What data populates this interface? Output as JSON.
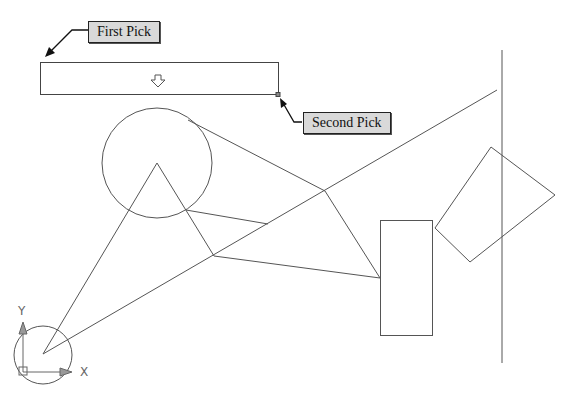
{
  "callouts": {
    "first_pick": "First Pick",
    "second_pick": "Second Pick"
  },
  "ucs": {
    "x_label": "X",
    "y_label": "Y"
  },
  "colors": {
    "line": "#555555",
    "callout_bg": "#d9d9d9",
    "callout_border": "#222222"
  },
  "geometry": {
    "selection_window": {
      "x1": 40,
      "y1": 62,
      "x2": 278,
      "y2": 94
    },
    "small_circle": {
      "cx": 43,
      "cy": 355,
      "r": 29
    },
    "large_circle": {
      "cx": 157,
      "cy": 163,
      "r": 55
    },
    "rectangle": {
      "x": 380,
      "y": 220,
      "w": 52,
      "h": 115
    },
    "rotated_rectangle": [
      [
        435,
        228
      ],
      [
        491,
        147
      ],
      [
        555,
        195
      ],
      [
        470,
        262
      ]
    ],
    "vertical_line": {
      "x": 502,
      "y1": 50,
      "y2": 363
    }
  }
}
